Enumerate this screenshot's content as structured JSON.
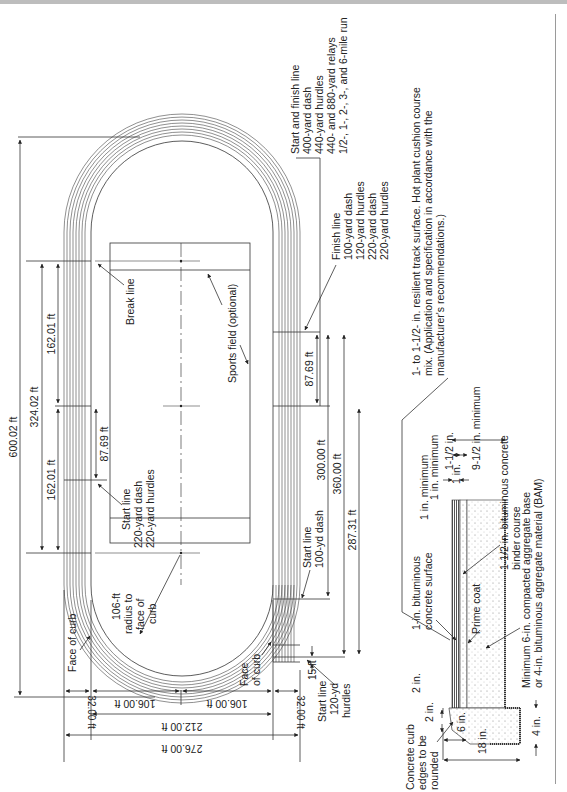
{
  "drawing": {
    "title": "Running track layout and cross section",
    "orientation": "rotated 90 degrees counter-clockwise",
    "dimensions_long_axis": {
      "overall": "600.02 ft",
      "straight_between_break_lines": "324.02 ft",
      "half_straight_upper": "162.01 ft",
      "half_straight_lower": "162.01 ft",
      "start_offset_220": "87.69 ft",
      "finish_offset": "87.69 ft",
      "dim_300": "300.00 ft",
      "dim_360": "360.00 ft",
      "dim_287": "287.31 ft",
      "dim_15": "15 ft"
    },
    "dimensions_short_axis": {
      "overall": "276.00 ft",
      "inside_curb": "212.00 ft",
      "radius_left": "106.00 ft",
      "radius_right": "106.00 ft",
      "lane_width_left": "32.00 ft",
      "lane_width_right": "32.00 ft"
    },
    "labels": {
      "break_line": "Break line",
      "sports_field": "Sports field (optional)",
      "radius_note": [
        "106-ft",
        "radius to",
        "face of",
        "curb"
      ],
      "face_of_curb_left": "Face of curb",
      "face_of_curb_right": [
        "Face",
        "of curb"
      ],
      "start_220": [
        "Start line",
        "220-yard dash",
        "220-yard hurdles"
      ],
      "start_100": [
        "Start line",
        "100-yd dash"
      ],
      "start_120": [
        "Start line",
        "120-yd",
        "hurdles"
      ],
      "finish_line": [
        "Finish line",
        "100-yard dash",
        "120-yard hurdles",
        "220-yard dash",
        "220-yard hurdles"
      ],
      "start_finish": [
        "Start and finish line",
        "400-yard dash",
        "440-yard hurdles",
        "440- and 880-yard relays",
        "1/2-, 1-, 2-, 3-, and 6-mile run"
      ]
    },
    "cross_section": {
      "surface_note": [
        "1- to 1-1/2- in. resilient track surface. Hot plant cushion course",
        "mix. (Application and specification in accordance with the",
        "manufacturer's recommendations.)"
      ],
      "one_in_min_top": "1 in. minimum",
      "dim_1_1_2": "1-1/2 in.",
      "dim_9_1_2": "9-1/2 in. minimum",
      "dim_1_in": "1 in.",
      "one_in_min": "1 in. minimum",
      "surface_layer": [
        "1-in. bituminous",
        "concrete surface"
      ],
      "binder_layer": [
        "1-1/2 in. bituminous concrete",
        "binder course"
      ],
      "prime_coat": "Prime coat",
      "base_layer": [
        "Minimum 6-in. compacted aggregate base",
        "or 4-in. bituminous aggregate material (BAM)"
      ],
      "curb_note": [
        "Concrete curb",
        "edges to be",
        "rounded"
      ],
      "dim_2_in_a": "2 in.",
      "dim_2_in_b": "2 in.",
      "dim_6_in": "6 in.",
      "dim_18_in": "18 in.",
      "dim_4_in": "4 in."
    }
  }
}
